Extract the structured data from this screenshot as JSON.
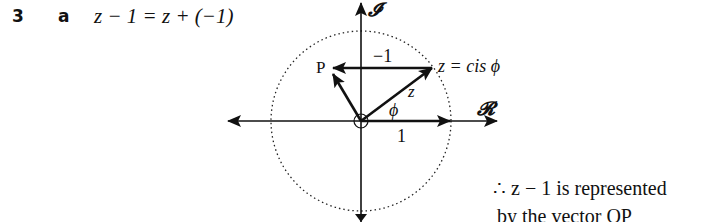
{
  "question": {
    "number": "3",
    "part": "a",
    "equation": "z − 1 = z + (−1)"
  },
  "diagram": {
    "axis_imag_label": "𝓘",
    "axis_real_label": "𝓡",
    "point_p_label": "P",
    "point_z_label": "z = cis ϕ",
    "vector_minus_one_label": "−1",
    "vector_z_label": "z",
    "angle_label": "ϕ",
    "unit_label": "1"
  },
  "conclusion": {
    "line1": "∴  z − 1 is represented",
    "line2": "by the vector OP"
  }
}
